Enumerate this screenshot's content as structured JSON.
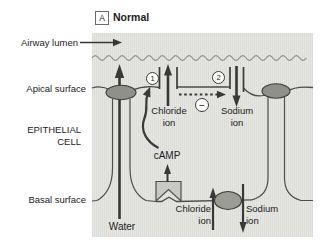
{
  "figure": {
    "panel_label": "A",
    "panel_title": "Normal"
  },
  "labels": {
    "airway_lumen": "Airway lumen",
    "apical_surface": "Apical surface",
    "epithelial_line1": "EPITHELIAL",
    "epithelial_line2": "CELL",
    "basal_surface": "Basal surface",
    "water": "Water",
    "camp": "cAMP"
  },
  "apical_channels": {
    "chloride": {
      "step": "1",
      "name_line1": "Chloride",
      "name_line2": "ion",
      "flow": "up-into-lumen"
    },
    "sodium": {
      "step": "2",
      "name_line1": "Sodium",
      "name_line2": "ion",
      "flow": "down-into-cell"
    },
    "inhibition_symbol": "−"
  },
  "basal_transport": {
    "chloride": {
      "name_line1": "Chloride",
      "name_line2": "ion",
      "flow": "up-into-cell"
    },
    "sodium": {
      "name_line1": "Sodium",
      "name_line2": "ion",
      "flow": "down-out-of-cell"
    }
  },
  "colors": {
    "diagram_bg": "#e6e6e2",
    "diagram_stripe": "#dcdcd8",
    "membrane": "#4c4c4a",
    "wave_line": "#8e8e8a",
    "junction_fill": "#90908b",
    "pump_fill": "#9c9c97",
    "receptor_fill": "#c9c9c4",
    "arrow": "#383836",
    "text": "#1c1c1c"
  }
}
